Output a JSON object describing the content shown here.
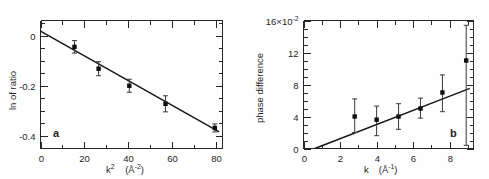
{
  "figure": {
    "title": "",
    "panel_a_tag": "a",
    "panel_b_tag": "b"
  },
  "chart_data": [
    {
      "type": "scatter",
      "panel": "a",
      "title": "",
      "xlabel": "k²  (Å⁻²)",
      "ylabel": "ln of ratio",
      "xlabel_base": "k",
      "xlabel_exp": "2",
      "xlabel_unit_open": "(",
      "xlabel_unit_sym": "Å",
      "xlabel_unit_exp": "-2",
      "xlabel_unit_close": ")",
      "xlim": [
        0,
        83
      ],
      "ylim": [
        -0.45,
        0.06
      ],
      "xticks": [
        0,
        20,
        40,
        60,
        80
      ],
      "xticklabels": [
        "0",
        "20",
        "40",
        "60",
        "80"
      ],
      "yticks": [
        0,
        -0.2,
        -0.4
      ],
      "yticklabels": [
        "0",
        "-0.2",
        "-0.4"
      ],
      "x_minor_step": 10,
      "y_minor_step": 0.05,
      "grid": false,
      "legend": "none",
      "x": [
        15.5,
        26.5,
        40.5,
        57.0,
        79.5
      ],
      "y": [
        -0.045,
        -0.132,
        -0.2,
        -0.272,
        -0.368
      ],
      "yerr": [
        0.025,
        0.028,
        0.026,
        0.032,
        0.016
      ],
      "fit": {
        "slope": -0.00493,
        "intercept": 0.018,
        "x0": 0.0,
        "x1": 81.5
      }
    },
    {
      "type": "scatter",
      "panel": "b",
      "title": "",
      "xlabel": "k   (Å⁻¹)",
      "ylabel": "phase difference",
      "xlabel_base": "k",
      "xlabel_unit_open": "(",
      "xlabel_unit_sym": "Å",
      "xlabel_unit_exp": "-1",
      "xlabel_unit_close": ")",
      "ylim": [
        0,
        16
      ],
      "xlim": [
        0,
        9.3
      ],
      "yaxis_scale_label": "16×10",
      "yaxis_scale_exp": "-2",
      "xticks": [
        0,
        2,
        4,
        6,
        8
      ],
      "xticklabels": [
        "0",
        "2",
        "4",
        "6",
        "8"
      ],
      "yticks": [
        0,
        4,
        8,
        12,
        16
      ],
      "yticklabels": [
        "0",
        "4",
        "8",
        "12",
        "16×10"
      ],
      "x_minor_step": 1,
      "y_minor_step": 1,
      "grid": false,
      "legend": "none",
      "x": [
        2.8,
        4.0,
        5.2,
        6.4,
        7.6,
        8.9
      ],
      "y": [
        4.0,
        3.6,
        4.0,
        5.0,
        7.0,
        11.0
      ],
      "yerr_low": [
        2.0,
        2.0,
        1.6,
        1.2,
        2.4,
        10.6
      ],
      "yerr_high": [
        2.2,
        1.7,
        1.6,
        1.3,
        2.2,
        4.4
      ],
      "fit": {
        "slope": 0.885,
        "intercept": -0.55,
        "x0": 0.62,
        "x1": 9.1
      }
    }
  ]
}
